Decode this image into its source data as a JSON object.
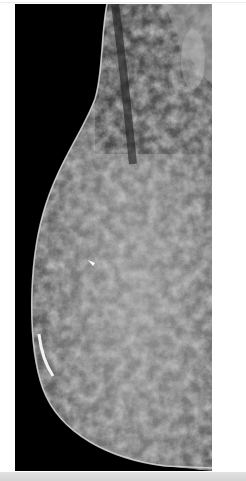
{
  "image": {
    "kind": "mammogram",
    "view": "mediolateral oblique",
    "description": "Grayscale X-ray mammogram of breast tissue with dense fibroglandular pattern",
    "colors": {
      "background": "#000000",
      "tissue_dark": "#3a3a3a",
      "tissue_mid": "#7a7a7a",
      "tissue_light": "#bdbdbd",
      "skin_line": "#d8d8d8",
      "page": "#ffffff",
      "bottom_bar": "#dcdcdc"
    },
    "markers": [
      {
        "type": "arrow",
        "label": "",
        "color": "#ffffff"
      }
    ]
  }
}
